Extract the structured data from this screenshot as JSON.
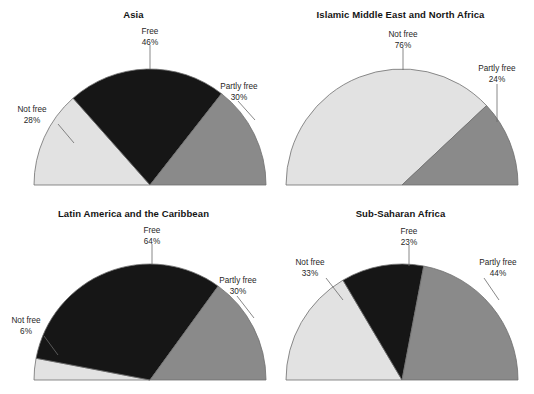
{
  "figure": {
    "background": "#ffffff",
    "palette": {
      "free": "#161616",
      "partly_free": "#8a8a8a",
      "not_free": "#e2e2e2",
      "outline": "#6e6e6e",
      "leader_line": "#6a6a6a",
      "text": "#1f1f1f"
    }
  },
  "chart_data": [
    {
      "type": "pie",
      "title": "Asia",
      "subtitle": "",
      "xlabel": "",
      "ylabel": "",
      "half_pie": true,
      "start_angle_deg": 180,
      "end_angle_deg": 0,
      "direction": "counterclockwise-from-left",
      "legend_position": "external-callouts",
      "grid": false,
      "categories": [
        "Not free",
        "Free",
        "Partly free"
      ],
      "values": [
        28,
        46,
        30
      ],
      "value_labels": [
        "28%",
        "30%",
        "46%"
      ],
      "slices": [
        {
          "label": "Not free",
          "value": 28,
          "value_label": "28%",
          "color": "#e2e2e2"
        },
        {
          "label": "Free",
          "value": 46,
          "value_label": "46%",
          "color": "#161616"
        },
        {
          "label": "Partly free",
          "value": 30,
          "value_label": "30%",
          "color": "#8a8a8a"
        }
      ]
    },
    {
      "type": "pie",
      "title": "Islamic Middle East and North Africa",
      "subtitle": "",
      "xlabel": "",
      "ylabel": "",
      "half_pie": true,
      "start_angle_deg": 180,
      "end_angle_deg": 0,
      "direction": "counterclockwise-from-left",
      "legend_position": "external-callouts",
      "grid": false,
      "categories": [
        "Not free",
        "Free",
        "Partly free"
      ],
      "values": [
        76,
        0,
        24
      ],
      "value_labels": [
        "76%",
        "24%"
      ],
      "slices": [
        {
          "label": "Not free",
          "value": 76,
          "value_label": "76%",
          "color": "#e2e2e2"
        },
        {
          "label": "Free",
          "value": 0,
          "value_label": "",
          "color": "#161616"
        },
        {
          "label": "Partly free",
          "value": 24,
          "value_label": "24%",
          "color": "#8a8a8a"
        }
      ]
    },
    {
      "type": "pie",
      "title": "Latin America and the Caribbean",
      "subtitle": "",
      "xlabel": "",
      "ylabel": "",
      "half_pie": true,
      "start_angle_deg": 180,
      "end_angle_deg": 0,
      "direction": "counterclockwise-from-left",
      "legend_position": "external-callouts",
      "grid": false,
      "categories": [
        "Not free",
        "Free",
        "Partly free"
      ],
      "values": [
        6,
        64,
        30
      ],
      "value_labels": [
        "6%",
        "64%",
        "30%"
      ],
      "slices": [
        {
          "label": "Not free",
          "value": 6,
          "value_label": "6%",
          "color": "#e2e2e2"
        },
        {
          "label": "Free",
          "value": 64,
          "value_label": "64%",
          "color": "#161616"
        },
        {
          "label": "Partly free",
          "value": 30,
          "value_label": "30%",
          "color": "#8a8a8a"
        }
      ]
    },
    {
      "type": "pie",
      "title": "Sub-Saharan Africa",
      "subtitle": "",
      "xlabel": "",
      "ylabel": "",
      "half_pie": true,
      "start_angle_deg": 180,
      "end_angle_deg": 0,
      "direction": "counterclockwise-from-left",
      "legend_position": "external-callouts",
      "grid": false,
      "categories": [
        "Not free",
        "Free",
        "Partly free"
      ],
      "values": [
        33,
        23,
        44
      ],
      "value_labels": [
        "33%",
        "23%",
        "44%"
      ],
      "slices": [
        {
          "label": "Not free",
          "value": 33,
          "value_label": "33%",
          "color": "#e2e2e2"
        },
        {
          "label": "Free",
          "value": 23,
          "value_label": "23%",
          "color": "#161616"
        },
        {
          "label": "Partly free",
          "value": 44,
          "value_label": "44%",
          "color": "#8a8a8a"
        }
      ]
    }
  ],
  "panels": {
    "asia": {
      "title": "Asia",
      "labels": {
        "free": {
          "name": "Free",
          "pct": "46%"
        },
        "partly_free": {
          "name": "Partly free",
          "pct": "30%"
        },
        "not_free": {
          "name": "Not free",
          "pct": "28%"
        }
      }
    },
    "imena": {
      "title": "Islamic Middle East and North Africa",
      "labels": {
        "not_free": {
          "name": "Not free",
          "pct": "76%"
        },
        "partly_free": {
          "name": "Partly free",
          "pct": "24%"
        }
      }
    },
    "latam": {
      "title": "Latin America and the Caribbean",
      "labels": {
        "free": {
          "name": "Free",
          "pct": "64%"
        },
        "partly_free": {
          "name": "Partly free",
          "pct": "30%"
        },
        "not_free": {
          "name": "Not free",
          "pct": "6%"
        }
      }
    },
    "ssa": {
      "title": "Sub-Saharan Africa",
      "labels": {
        "free": {
          "name": "Free",
          "pct": "23%"
        },
        "partly_free": {
          "name": "Partly free",
          "pct": "44%"
        },
        "not_free": {
          "name": "Not free",
          "pct": "33%"
        }
      }
    }
  }
}
